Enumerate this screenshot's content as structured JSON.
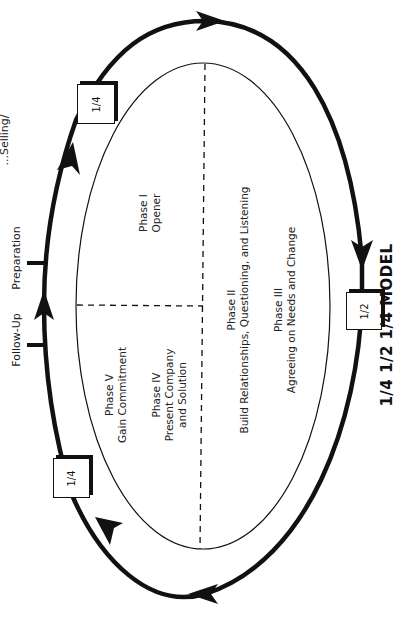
{
  "diagram": {
    "title": "1/4 1/2 1/4 MODEL",
    "orientation": "rotated -90deg",
    "cycle_labels": {
      "top_cut": "...Selling/",
      "follow_up": "Follow-Up",
      "preparation": "Preparation"
    },
    "boxes": [
      {
        "id": "top-left",
        "label": "1/4"
      },
      {
        "id": "right",
        "label": "1/2"
      },
      {
        "id": "bottom-left",
        "label": "1/4"
      }
    ],
    "phases": {
      "phase1": {
        "title": "Phase I",
        "desc": "Opener"
      },
      "phase2": {
        "title": "Phase II",
        "desc": "Build Relationships, Questioning, and Listening"
      },
      "phase3": {
        "title": "Phase III",
        "desc": "Agreeing on Needs and Change"
      },
      "phase4": {
        "title": "Phase IV",
        "desc_line1": "Present Company",
        "desc_line2": "and Solution"
      },
      "phase5": {
        "title": "Phase V",
        "desc": "Gain Commitment"
      }
    },
    "colors": {
      "line": "#111111",
      "background": "#ffffff"
    }
  }
}
